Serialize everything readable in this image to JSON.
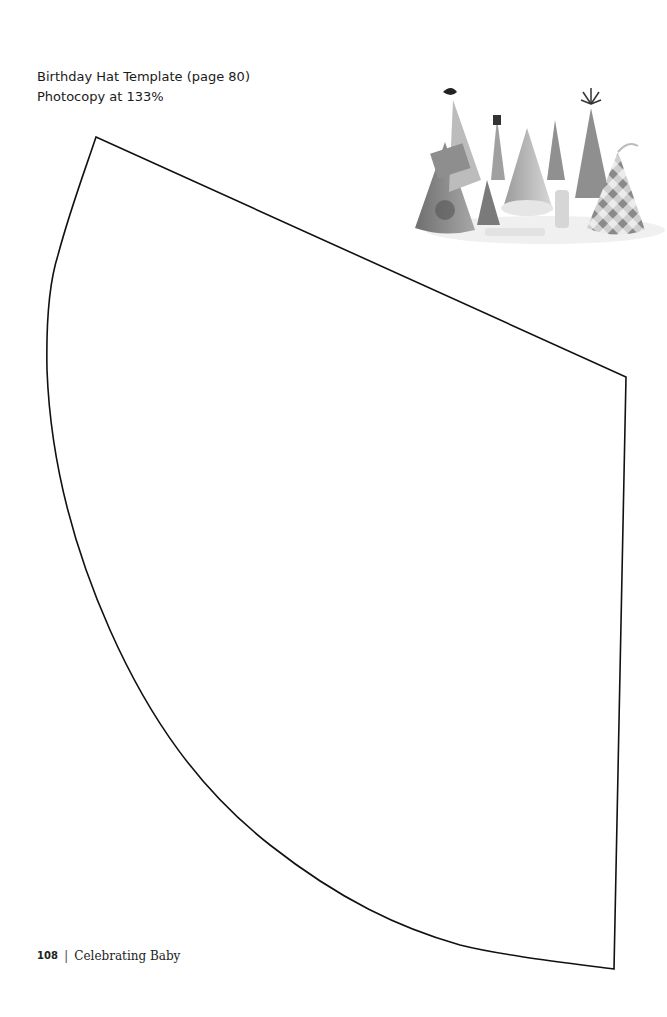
{
  "caption": {
    "title": "Birthday Hat Template (page 80)",
    "instruction": "Photocopy at 133%"
  },
  "photo": {
    "description": "party-hats-photo",
    "alt": "Assorted decorated paper party hats"
  },
  "template": {
    "shape": "cone-hat-cutout",
    "stroke_color": "#111111"
  },
  "footer": {
    "page_number": "108",
    "separator": "|",
    "book_title": "Celebrating Baby"
  }
}
